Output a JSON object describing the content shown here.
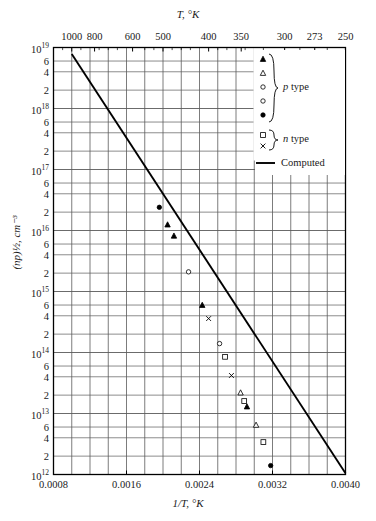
{
  "chart_data": {
    "type": "scatter",
    "title": "",
    "xlabel": "1/T, °K",
    "ylabel": "(np)½, cm⁻³",
    "top_axis_label": "T, °K",
    "xlim": [
      0.0008,
      0.004
    ],
    "ylim": [
      1000000000000.0,
      1e+19
    ],
    "yscale": "log",
    "xscale": "linear",
    "grid": true,
    "legend_position": "top-right-inside",
    "x_ticks": [
      {
        "value": 0.0008,
        "label": "0.0008"
      },
      {
        "value": 0.0016,
        "label": "0.0016"
      },
      {
        "value": 0.0024,
        "label": "0.0024"
      },
      {
        "value": 0.0032,
        "label": "0.0032"
      },
      {
        "value": 0.004,
        "label": "0.0040"
      }
    ],
    "x_minor_ticks": [
      0.001,
      0.0012,
      0.0014,
      0.0018,
      0.002,
      0.0022,
      0.0026,
      0.0028,
      0.003,
      0.0034,
      0.0036,
      0.0038
    ],
    "top_ticks": [
      {
        "T": 1000,
        "inv": 0.001,
        "label": "1000"
      },
      {
        "T": 800,
        "inv": 0.00125,
        "label": "800"
      },
      {
        "T": 600,
        "inv": 0.0016667,
        "label": "600"
      },
      {
        "T": 500,
        "inv": 0.002,
        "label": "500"
      },
      {
        "T": 400,
        "inv": 0.0025,
        "label": "400"
      },
      {
        "T": 350,
        "inv": 0.0028571,
        "label": "350"
      },
      {
        "T": 300,
        "inv": 0.0033333,
        "label": "300"
      },
      {
        "T": 273,
        "inv": 0.003663,
        "label": "273"
      },
      {
        "T": 250,
        "inv": 0.004,
        "label": "250"
      }
    ],
    "y_decades": [
      {
        "value": 1e+19,
        "label": "10",
        "exp": "19"
      },
      {
        "value": 1e+18,
        "label": "10",
        "exp": "18"
      },
      {
        "value": 1e+17,
        "label": "10",
        "exp": "17"
      },
      {
        "value": 1e+16,
        "label": "10",
        "exp": "16"
      },
      {
        "value": 1000000000000000.0,
        "label": "10",
        "exp": "15"
      },
      {
        "value": 100000000000000.0,
        "label": "10",
        "exp": "14"
      },
      {
        "value": 10000000000000.0,
        "label": "10",
        "exp": "13"
      },
      {
        "value": 1000000000000.0,
        "label": "10",
        "exp": "12"
      }
    ],
    "y_minor_labels": [
      "6",
      "4",
      "2"
    ],
    "y_minor_mantissas": [
      6,
      4,
      2
    ],
    "series": [
      {
        "name": "Computed",
        "marker": "line",
        "type": "line",
        "points": [
          {
            "x": 0.001,
            "y": 7.8e+18
          },
          {
            "x": 0.004,
            "y": 1050000000000.0
          }
        ]
      },
      {
        "name": "p type",
        "marker": "filled-triangle",
        "points": [
          {
            "x": 0.00205,
            "y": 1.25e+16
          },
          {
            "x": 0.00212,
            "y": 8200000000000000.0
          },
          {
            "x": 0.00243,
            "y": 600000000000000.0
          },
          {
            "x": 0.00292,
            "y": 13000000000000.0
          }
        ]
      },
      {
        "name": "p type",
        "marker": "open-triangle",
        "points": [
          {
            "x": 0.00285,
            "y": 22000000000000.0
          },
          {
            "x": 0.00302,
            "y": 6500000000000.0
          }
        ]
      },
      {
        "name": "p type",
        "marker": "open-circle",
        "points": [
          {
            "x": 0.00228,
            "y": 2100000000000000.0
          },
          {
            "x": 0.00262,
            "y": 140000000000000.0
          }
        ]
      },
      {
        "name": "p type",
        "marker": "filled-circle",
        "points": [
          {
            "x": 0.00318,
            "y": 1400000000000.0
          },
          {
            "x": 0.00196,
            "y": 2.4e+16
          }
        ]
      },
      {
        "name": "n type",
        "marker": "open-square",
        "points": [
          {
            "x": 0.00268,
            "y": 85000000000000.0
          },
          {
            "x": 0.00289,
            "y": 16000000000000.0
          },
          {
            "x": 0.0031,
            "y": 3400000000000.0
          },
          {
            "x": 0.0033,
            "y": 850000000000.0
          },
          {
            "x": 0.00352,
            "y": 200000000000.0
          },
          {
            "x": 0.00372,
            "y": 55000000000.0
          }
        ]
      },
      {
        "name": "n type",
        "marker": "cross",
        "points": [
          {
            "x": 0.0025,
            "y": 360000000000000.0
          },
          {
            "x": 0.00275,
            "y": 42000000000000.0
          }
        ]
      }
    ]
  },
  "legend": {
    "p_type_label": "p type",
    "p_type_label_italic": "p",
    "p_type_label_rest": " type",
    "n_type_label": "n type",
    "n_type_label_italic": "n",
    "n_type_label_rest": " type",
    "computed_label": "Computed",
    "p_markers": [
      "filled-triangle",
      "open-triangle",
      "open-circle",
      "open-circle",
      "filled-circle"
    ],
    "n_markers": [
      "open-square",
      "cross"
    ]
  },
  "colors": {
    "line": "#000000",
    "grid": "#5a5a5a",
    "frame": "#000000",
    "text": "#1a1a1a",
    "background": "#ffffff"
  }
}
